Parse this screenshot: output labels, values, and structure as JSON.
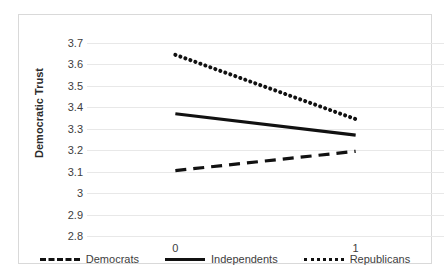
{
  "chart_data": {
    "type": "line",
    "title": "",
    "xlabel": "",
    "ylabel": "Democratic Trust",
    "x": [
      0,
      1
    ],
    "x_tick_labels": [
      "0",
      "1"
    ],
    "xlim": [
      -0.49,
      1.49
    ],
    "ylim": [
      2.8,
      3.7
    ],
    "y_tick_labels": [
      "3.7",
      "3.6",
      "3.5",
      "3.4",
      "3.3",
      "3.2",
      "3.1",
      "3",
      "2.9",
      "2.8"
    ],
    "y_ticks": [
      3.7,
      3.6,
      3.5,
      3.4,
      3.3,
      3.2,
      3.1,
      3.0,
      2.9,
      2.8
    ],
    "grid": true,
    "legend_position": "bottom",
    "series": [
      {
        "name": "Democrats",
        "values": [
          3.105,
          3.195
        ],
        "style": "dashed",
        "color": "#111111"
      },
      {
        "name": "Independents",
        "values": [
          3.37,
          3.27
        ],
        "style": "solid",
        "color": "#111111"
      },
      {
        "name": "Republicans",
        "values": [
          3.645,
          3.345
        ],
        "style": "dotted",
        "color": "#111111"
      }
    ]
  },
  "axis": {
    "y_title": "Democratic Trust",
    "y_tick_labels": [
      "3.7",
      "3.6",
      "3.5",
      "3.4",
      "3.3",
      "3.2",
      "3.1",
      "3",
      "2.9",
      "2.8"
    ],
    "x_tick_labels": [
      "0",
      "1"
    ]
  },
  "legend": {
    "items": [
      {
        "label": "Democrats",
        "style": "dashed"
      },
      {
        "label": "Independents",
        "style": "solid"
      },
      {
        "label": "Republicans",
        "style": "dotted"
      }
    ]
  },
  "colors": {
    "series": "#111111",
    "gridline": "#e8e8e8",
    "frame": "#d9d9d9",
    "text": "#3d3d3d",
    "background": "#ffffff"
  }
}
